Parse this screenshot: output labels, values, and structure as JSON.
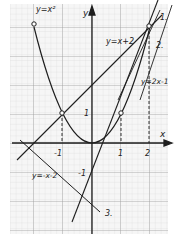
{
  "figure": {
    "axes": {
      "x_label": "x",
      "y_label": "y"
    },
    "ticks": {
      "x_neg1": "-1",
      "x_1": "1",
      "x_2": "2",
      "y_1": "1",
      "y_neg1": "-1"
    },
    "curves": {
      "parabola": "y=x²",
      "line_a": "y=x+2",
      "line_b": "y=2x-1",
      "line_c": "y=-x-2"
    },
    "markers": {
      "m1": "1.",
      "m2": "2.",
      "m3": "3."
    },
    "colors": {
      "grid_minor": "#d4d4d4",
      "grid_major": "#9a9a9a",
      "ink": "#1e1e1e"
    }
  }
}
